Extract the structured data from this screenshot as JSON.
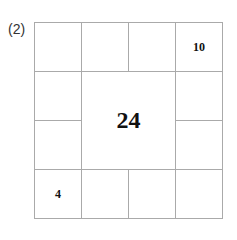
{
  "problem_label": "(2)",
  "grid": {
    "center_value": "24",
    "cells": {
      "r0c0": "",
      "r0c1": "",
      "r0c2": "",
      "r0c3": "10",
      "r1c0": "",
      "r1c3": "",
      "r2c0": "",
      "r2c3": "",
      "r3c0": "4",
      "r3c1": "",
      "r3c2": "",
      "r3c3": ""
    }
  }
}
